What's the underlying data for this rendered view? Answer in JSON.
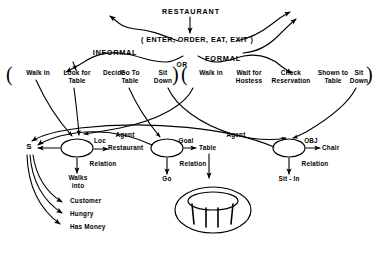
{
  "diagram": {
    "ink_color": "#000000",
    "background": "#ffffff"
  },
  "script": {
    "name": "RESTAURANT",
    "expansion": "( ENTER, ORDER, EAT, EXIT )"
  },
  "branch": {
    "left_label": "INFORMAL",
    "right_label": "FORMAL",
    "connector": "OR"
  },
  "sequences": [
    {
      "id": "informal",
      "open_paren": "(",
      "close_paren": ")",
      "actions": [
        {
          "line1": "Walk in",
          "line2": ""
        },
        {
          "line1": "Look for",
          "line2": "Table"
        },
        {
          "line1": "Decide",
          "line2": ""
        },
        {
          "line1": "Go To",
          "line2": "Table"
        },
        {
          "line1": "Sit",
          "line2": "Down"
        }
      ]
    },
    {
      "id": "formal",
      "open_paren": "(",
      "close_paren": ")",
      "actions": [
        {
          "line1": "Walk in",
          "line2": ""
        },
        {
          "line1": "Wait for",
          "line2": "Hostess"
        },
        {
          "line1": "Check",
          "line2": "Reservation"
        },
        {
          "line1": "Shown to",
          "line2": "Table"
        },
        {
          "line1": "Sit",
          "line2": "Down"
        }
      ]
    }
  ],
  "subject_node": {
    "label": "S"
  },
  "event_nodes": [
    {
      "id": "walks-into",
      "agent_arc": "Agent",
      "role_arc": "Loc",
      "role_value": "Restaurant",
      "relation_arc": "Relation",
      "relation_value_line1": "Walks",
      "relation_value_line2": "into"
    },
    {
      "id": "go",
      "agent_arc": "Agent",
      "role_arc": "Goal",
      "role_value": "Table",
      "relation_arc": "Relation",
      "relation_value_line1": "Go",
      "relation_value_line2": ""
    },
    {
      "id": "sit-in",
      "agent_arc": "Agent",
      "role_arc": "OBJ",
      "role_value": "Chair",
      "relation_arc": "Relation",
      "relation_value_line1": "Sit - In",
      "relation_value_line2": ""
    }
  ],
  "subject_properties": [
    {
      "label": "Customer"
    },
    {
      "label": "Hungry"
    },
    {
      "label": "Has Money"
    }
  ],
  "table_picture": {
    "caption": "round table illustration"
  }
}
